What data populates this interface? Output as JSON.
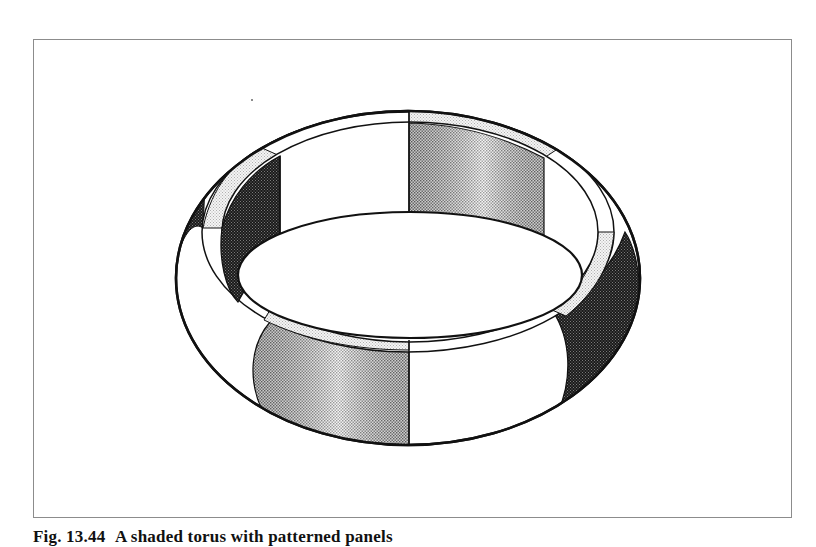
{
  "figure": {
    "type": "illustration",
    "stroke_color": "#111111",
    "shades": {
      "light": "#e6e6e6",
      "medium": "#b5b5b5",
      "dark": "#2a2a2a",
      "white": "#ffffff"
    },
    "segments_visible": [
      {
        "position": "back-center-left",
        "shade": "white"
      },
      {
        "position": "back-center-right",
        "shade": "medium"
      },
      {
        "position": "back-left",
        "shade": "dark"
      },
      {
        "position": "back-right",
        "shade": "white"
      },
      {
        "position": "front-center-left",
        "shade": "medium"
      },
      {
        "position": "front-center-right",
        "shade": "white"
      },
      {
        "position": "front-left",
        "shade": "white"
      },
      {
        "position": "front-right",
        "shade": "dark"
      }
    ]
  },
  "caption": {
    "label": "Fig. 13.44",
    "text": "A shaded torus with patterned panels"
  }
}
